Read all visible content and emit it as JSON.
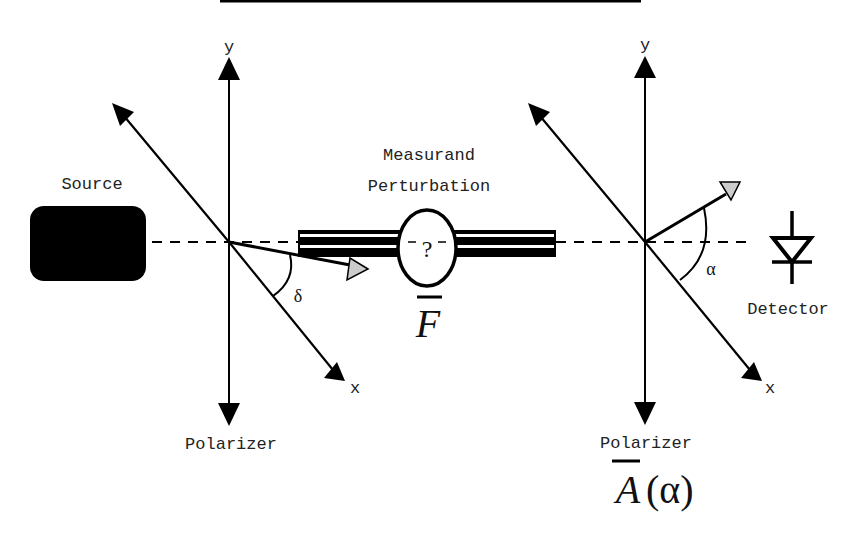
{
  "labels": {
    "source": "Source",
    "measurand_line1": "Measurand",
    "measurand_line2": "Perturbation",
    "unknown_symbol": "?",
    "force_symbol": "F",
    "detector": "Detector",
    "polarizer_left": "Polarizer",
    "polarizer_right": "Polarizer",
    "analyzer_symbol": "A(α)",
    "analyzer_letter": "A",
    "analyzer_arg": "(α)",
    "y_axis_left": "y",
    "y_axis_right": "y",
    "x_axis_left": "x",
    "x_axis_right": "x",
    "angle_left": "δ",
    "angle_right": "α"
  },
  "colors": {
    "ink": "#000000",
    "text": "#222222",
    "pointer_fill": "#cccccc",
    "background": "#ffffff"
  },
  "components": [
    {
      "id": "source",
      "label": "Source",
      "shape": "rounded-rect"
    },
    {
      "id": "polarizer-left",
      "label": "Polarizer",
      "axes": [
        "x",
        "y"
      ],
      "angle": "δ"
    },
    {
      "id": "measurand",
      "label": "Measurand Perturbation",
      "symbol": "F"
    },
    {
      "id": "polarizer-right",
      "label": "Polarizer",
      "axes": [
        "x",
        "y"
      ],
      "angle": "α",
      "symbol": "A(α)"
    },
    {
      "id": "detector",
      "label": "Detector",
      "shape": "photodiode"
    }
  ]
}
